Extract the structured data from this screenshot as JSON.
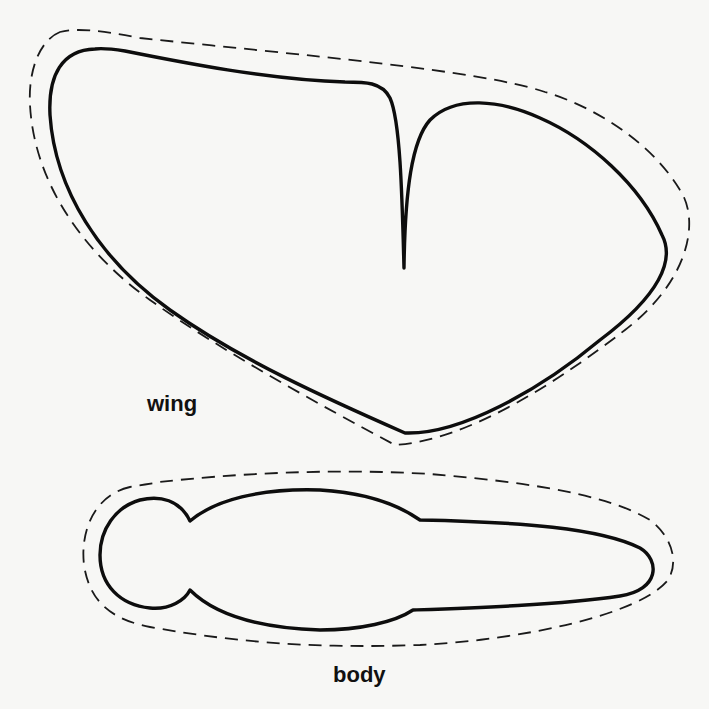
{
  "diagram": {
    "type": "pattern-template",
    "shapes": [
      {
        "id": "wing",
        "label": "wing",
        "outline": "solid cut line",
        "allowance": "dashed outline"
      },
      {
        "id": "body",
        "label": "body",
        "outline": "solid cut line",
        "allowance": "dashed outline"
      }
    ]
  },
  "labels": {
    "wing": "wing",
    "body": "body"
  },
  "colors": {
    "background": "#f7f7f5",
    "stroke": "#0d0d0d"
  }
}
